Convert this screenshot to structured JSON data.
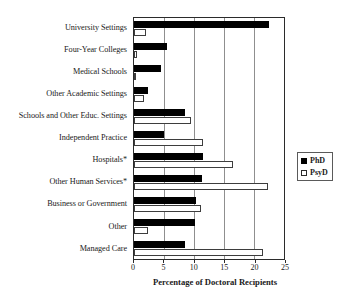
{
  "chart_data": {
    "type": "bar",
    "orientation": "horizontal",
    "title": "",
    "xlabel": "Percentage of Doctoral Recipients",
    "ylabel": "",
    "xlim": [
      0,
      25
    ],
    "xticks": [
      0,
      5,
      10,
      15,
      20,
      25
    ],
    "grid": true,
    "legend_position": "right",
    "categories": [
      "University Settings",
      "Four-Year Colleges",
      "Medical Schools",
      "Other Academic Settings",
      "Schools and Other Educ. Settings",
      "Independent Practice",
      "Hospitals*",
      "Other Human Services*",
      "Business or Government",
      "Other",
      "Managed Care"
    ],
    "series": [
      {
        "name": "PhD",
        "color": "#000000",
        "style": "filled",
        "values": [
          22.5,
          5.5,
          4.5,
          2.3,
          8.5,
          5.0,
          11.5,
          11.3,
          10.3,
          10.2,
          8.5
        ]
      },
      {
        "name": "PsyD",
        "color": "#ffffff",
        "style": "hollow",
        "values": [
          2.0,
          0.5,
          0.4,
          1.7,
          9.5,
          11.5,
          16.5,
          22.3,
          11.2,
          2.3,
          21.5
        ]
      }
    ]
  },
  "legend": {
    "items": [
      {
        "label": "PhD",
        "style": "filled"
      },
      {
        "label": "PsyD",
        "style": "hollow"
      }
    ]
  }
}
